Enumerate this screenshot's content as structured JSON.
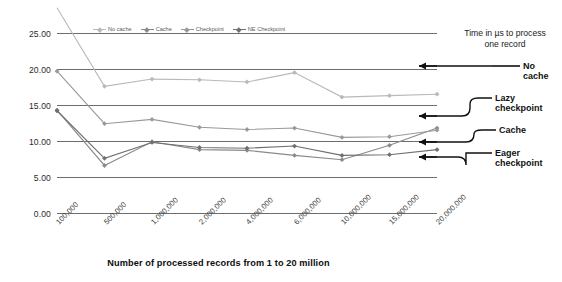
{
  "chart_data": {
    "type": "line",
    "title": "",
    "xlabel": "Number of processed records from 1 to 20 million",
    "ylabel": "Time in µs to process one record",
    "ylim": [
      0,
      25
    ],
    "yticks": [
      "0.00",
      "5.00",
      "10.00",
      "15.00",
      "20.00",
      "25.00"
    ],
    "grid": true,
    "legend_position": "top-inside",
    "categories": [
      "100,000",
      "500,000",
      "1,000,000",
      "2,000,000",
      "4,000,000",
      "6,000,000",
      "10,000,000",
      "15,000,000",
      "20,000,000"
    ],
    "series": [
      {
        "name": "No cache",
        "color": "#b9b9b9",
        "values": [
          28.5,
          17.6,
          18.6,
          18.5,
          18.2,
          19.5,
          16.1,
          16.3,
          16.5
        ]
      },
      {
        "name": "Cache",
        "color": "#8a8a8a",
        "values": [
          14.3,
          6.6,
          9.9,
          8.8,
          8.7,
          8.0,
          7.4,
          9.4,
          11.8
        ]
      },
      {
        "name": "Checkpoint",
        "color": "#999999",
        "values": [
          19.7,
          12.4,
          13.0,
          11.9,
          11.6,
          11.8,
          10.5,
          10.6,
          11.5
        ]
      },
      {
        "name": "NE Checkpoint",
        "color": "#6f6f6f",
        "values": [
          14.2,
          7.6,
          9.8,
          9.1,
          9.0,
          9.3,
          8.0,
          8.1,
          8.8
        ]
      }
    ],
    "annotations": [
      {
        "text": "No cache",
        "value": 16.5
      },
      {
        "text": "Lazy checkpoint",
        "value": 11.5
      },
      {
        "text": "Cache",
        "value": 10.6
      },
      {
        "text": "Eager checkpoint",
        "value": 8.8
      }
    ]
  },
  "legend": {
    "items": [
      {
        "label": "No cache"
      },
      {
        "label": "Cache"
      },
      {
        "label": "Checkpoint"
      },
      {
        "label": "NE Checkpoint"
      }
    ]
  },
  "axis": {
    "y_title": "Time in µs to process one record",
    "y_title_line1": "Time in µs to process",
    "y_title_line2": "one record",
    "x_title": "Number of processed records from 1 to 20 million"
  },
  "callouts": {
    "no_cache": "No cache",
    "lazy_line1": "Lazy",
    "lazy_line2": "checkpoint",
    "cache": "Cache",
    "eager_line1": "Eager",
    "eager_line2": "checkpoint"
  }
}
